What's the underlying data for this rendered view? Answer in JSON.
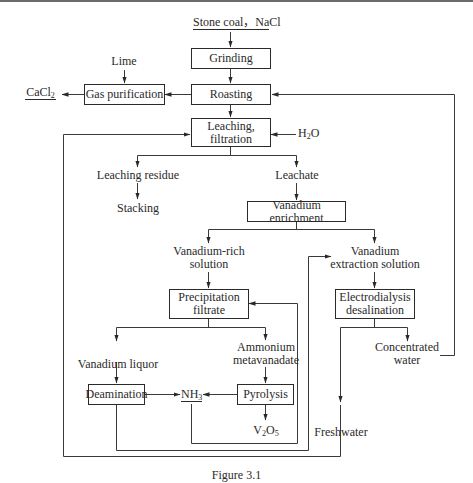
{
  "diagram": {
    "inputs": {
      "feed": "Stone coal，NaCl",
      "lime": "Lime",
      "water_main": "H",
      "water_sub": "2",
      "water_tail": "O"
    },
    "products": {
      "cacl2_main": "CaCl",
      "cacl2_sub": "2",
      "nh3_main": "NH",
      "nh3_sub": "3",
      "v2o5_a": "V",
      "v2o5_sub1": "2",
      "v2o5_b": "O",
      "v2o5_sub2": "5"
    },
    "process_boxes": {
      "grinding": "Grinding",
      "roasting": "Roasting",
      "gas_purification": "Gas purification",
      "leaching_line1": "Leaching,",
      "leaching_line2": "filtration",
      "vanadium_enrichment": "Vanadium enrichment",
      "precipitation_line1": "Precipitation",
      "precipitation_line2": "filtrate",
      "electrodialysis_line1": "Electrodialysis",
      "electrodialysis_line2": "desalination",
      "deamination": "Deamination",
      "pyrolysis": "Pyrolysis"
    },
    "streams": {
      "leaching_residue": "Leaching residue",
      "stacking": "Stacking",
      "leachate": "Leachate",
      "vanadium_rich_line1": "Vanadium-rich",
      "vanadium_rich_line2": "solution",
      "vanadium_extraction_line1": "Vanadium",
      "vanadium_extraction_line2": "extraction solution",
      "vanadium_liquor": "Vanadium liquor",
      "ammonium_line1": "Ammonium",
      "ammonium_line2": "metavanadate",
      "concentrated_line1": "Concentrated",
      "concentrated_line2": "water",
      "freshwater": "Freshwater"
    },
    "caption": "Figure 3.1"
  }
}
